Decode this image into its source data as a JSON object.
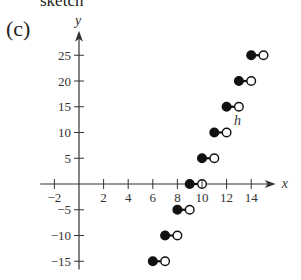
{
  "header": {
    "cut_title": "sketch",
    "panel_label": "(c)"
  },
  "chart_data": {
    "type": "scatter",
    "subtype": "step-function",
    "title": "",
    "xlabel": "x",
    "ylabel": "y",
    "function_label": "h",
    "xlim": [
      -2.5,
      15.5
    ],
    "ylim": [
      -17,
      29
    ],
    "x_ticks": [
      -2,
      2,
      4,
      6,
      8,
      10,
      12,
      14
    ],
    "y_ticks": [
      -15,
      -10,
      -5,
      5,
      10,
      15,
      20,
      25
    ],
    "grid": false,
    "legend": null,
    "segments": [
      {
        "x_start": 6,
        "x_end": 7,
        "y": -15,
        "start_closed": true,
        "end_closed": false
      },
      {
        "x_start": 7,
        "x_end": 8,
        "y": -10,
        "start_closed": true,
        "end_closed": false
      },
      {
        "x_start": 8,
        "x_end": 9,
        "y": -5,
        "start_closed": true,
        "end_closed": false
      },
      {
        "x_start": 9,
        "x_end": 10,
        "y": 0,
        "start_closed": true,
        "end_closed": false
      },
      {
        "x_start": 10,
        "x_end": 11,
        "y": 5,
        "start_closed": true,
        "end_closed": false
      },
      {
        "x_start": 11,
        "x_end": 12,
        "y": 10,
        "start_closed": true,
        "end_closed": false
      },
      {
        "x_start": 12,
        "x_end": 13,
        "y": 15,
        "start_closed": true,
        "end_closed": false
      },
      {
        "x_start": 13,
        "x_end": 14,
        "y": 20,
        "start_closed": true,
        "end_closed": false
      },
      {
        "x_start": 14,
        "x_end": 15,
        "y": 25,
        "start_closed": true,
        "end_closed": false
      }
    ]
  }
}
